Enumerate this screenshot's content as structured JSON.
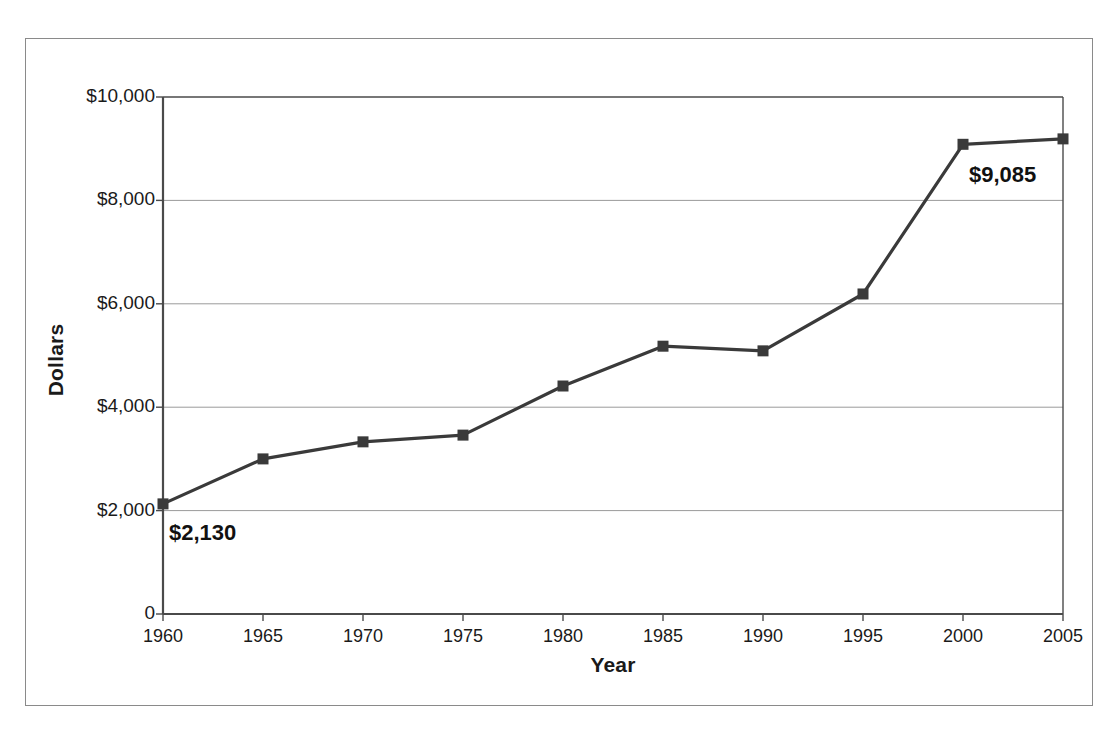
{
  "chart_data": {
    "type": "line",
    "title": "",
    "xlabel": "Year",
    "ylabel": "Dollars",
    "categories": [
      1960,
      1965,
      1970,
      1975,
      1980,
      1985,
      1990,
      1995,
      2000,
      2005
    ],
    "x_tick_labels": [
      "1960",
      "1965",
      "1970",
      "1975",
      "1980",
      "1985",
      "1990",
      "1995",
      "2000",
      "2005"
    ],
    "values": [
      2130,
      3000,
      3330,
      3460,
      4410,
      5180,
      5090,
      6190,
      9085,
      9190
    ],
    "series": [
      {
        "name": "Dollars",
        "values": [
          2130,
          3000,
          3330,
          3460,
          4410,
          5180,
          5090,
          6190,
          9085,
          9190
        ]
      }
    ],
    "ylim": [
      0,
      10000
    ],
    "xlim": [
      1960,
      2005
    ],
    "y_ticks": [
      0,
      2000,
      4000,
      6000,
      8000,
      10000
    ],
    "y_tick_labels": [
      "0",
      "$2,000",
      "$4,000",
      "$6,000",
      "$8,000",
      "$10,000"
    ],
    "grid": "horizontal",
    "legend": "none",
    "marker": "square",
    "line_color": "#3a3a3a",
    "marker_color": "#3a3a3a",
    "grid_color": "#9a9a9a",
    "axis_color": "#4a4a4a",
    "annotations": [
      {
        "label": "$2,130",
        "x": 1960,
        "y": 2130
      },
      {
        "label": "$9,085",
        "x": 2000,
        "y": 9085
      }
    ]
  },
  "axes": {
    "y_title": "Dollars",
    "x_title": "Year"
  }
}
